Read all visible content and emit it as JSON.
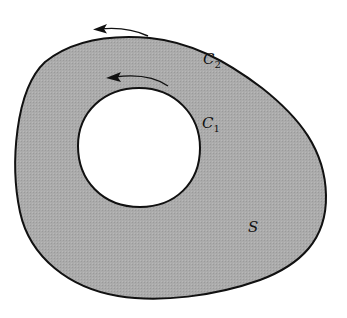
{
  "diagram": {
    "type": "region-with-hole",
    "colors": {
      "region_fill": "#a9a9a9",
      "stroke": "#111111",
      "hole_fill": "#ffffff",
      "background": "#ffffff"
    },
    "labels": {
      "outer_curve": {
        "main": "C",
        "sub": "2"
      },
      "inner_curve": {
        "main": "C",
        "sub": "1"
      },
      "region": {
        "main": "S"
      }
    },
    "arrows": [
      {
        "name": "outer-orientation-arrow",
        "direction": "counterclockwise"
      },
      {
        "name": "inner-orientation-arrow",
        "direction": "counterclockwise"
      }
    ]
  }
}
